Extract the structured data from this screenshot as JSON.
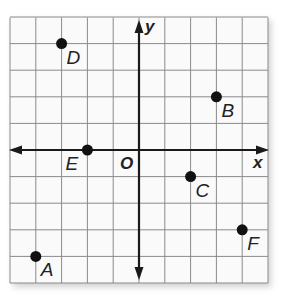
{
  "diagram": {
    "type": "coordinate-plane",
    "axes": {
      "x_label": "x",
      "y_label": "y",
      "origin_label": "O"
    },
    "grid": {
      "x_min": -5,
      "x_max": 5,
      "y_min": -5,
      "y_max": 5,
      "step": 1
    },
    "colors": {
      "grid": "#8a8a8a",
      "axis": "#1a1a1a",
      "point": "#111111",
      "background": "#fafafa"
    },
    "points": [
      {
        "label": "A",
        "x": -4,
        "y": -4
      },
      {
        "label": "B",
        "x": 3,
        "y": 2
      },
      {
        "label": "C",
        "x": 2,
        "y": -1
      },
      {
        "label": "D",
        "x": -3,
        "y": 4
      },
      {
        "label": "E",
        "x": -2,
        "y": 0
      },
      {
        "label": "F",
        "x": 4,
        "y": -3
      }
    ]
  }
}
